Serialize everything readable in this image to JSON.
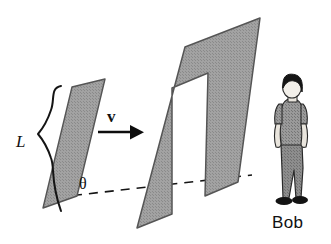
{
  "figure": {
    "background_color": "#ffffff",
    "width": 331,
    "height": 244,
    "labels": {
      "length": "L",
      "angle": "θ",
      "velocity": "v",
      "observer": "Bob"
    },
    "colors": {
      "plate_fill": "#9d9d9d",
      "plate_stroke": "#4a4a4a",
      "line": "#101010",
      "hair": "#1a1a1a",
      "skin": "#f2efe9",
      "shirt": "#8e8e8e",
      "trousers": "#7c7c7c",
      "shoes": "#1c1c1c",
      "text": "#111111"
    },
    "elements": [
      {
        "name": "small-plate",
        "kind": "parallelogram",
        "points": "72,87 105,79 77,196 43,208"
      },
      {
        "name": "slotted-plate",
        "kind": "polygon-with-hole",
        "outer": "185,47 260,18 238,182 205,196 208,73 172,88 172,214 137,228",
        "hole": "208,73 231,64 205,196 181,207"
      },
      {
        "name": "velocity-arrow",
        "kind": "arrow",
        "from": "98,132",
        "to": "141,132"
      },
      {
        "name": "angle-baseline",
        "kind": "dashed-line",
        "from": "73,195",
        "to": "250,175"
      },
      {
        "name": "length-brace",
        "kind": "curly-brace",
        "from": "52,86",
        "to": "52,211"
      },
      {
        "name": "observer-figure",
        "kind": "person",
        "position": "270,88"
      }
    ]
  }
}
